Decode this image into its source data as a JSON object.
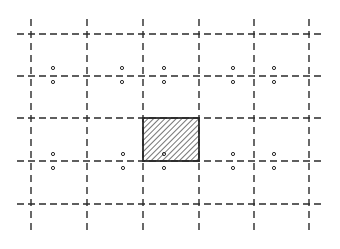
{
  "diagram": {
    "type": "dashed-grid-with-hatched-cell",
    "colors": {
      "background": "#ffffff",
      "line": "#2a2a2a",
      "hatch": "#2a2a2a",
      "dot": "#2a2a2a"
    },
    "vertical_lines": [
      {
        "x": 31,
        "y1": 19,
        "y2": 234
      },
      {
        "x": 87,
        "y1": 19,
        "y2": 234
      },
      {
        "x": 143,
        "y1": 19,
        "y2": 234
      },
      {
        "x": 199,
        "y1": 19,
        "y2": 234
      },
      {
        "x": 254,
        "y1": 19,
        "y2": 234
      },
      {
        "x": 309,
        "y1": 19,
        "y2": 234
      }
    ],
    "horizontal_lines": [
      {
        "y": 34,
        "x1": 17,
        "x2": 322
      },
      {
        "y": 76,
        "x1": 17,
        "x2": 322
      },
      {
        "y": 118,
        "x1": 17,
        "x2": 322
      },
      {
        "y": 161,
        "x1": 17,
        "x2": 322
      },
      {
        "y": 204,
        "x1": 17,
        "x2": 322
      }
    ],
    "hatched_cell": {
      "x": 143,
      "y": 118,
      "width": 56,
      "height": 43
    },
    "dots": [
      {
        "x": 53,
        "y": 68
      },
      {
        "x": 53,
        "y": 82
      },
      {
        "x": 122,
        "y": 68
      },
      {
        "x": 122,
        "y": 82
      },
      {
        "x": 164,
        "y": 68
      },
      {
        "x": 164,
        "y": 82
      },
      {
        "x": 233,
        "y": 68
      },
      {
        "x": 233,
        "y": 82
      },
      {
        "x": 274,
        "y": 68
      },
      {
        "x": 274,
        "y": 82
      },
      {
        "x": 53,
        "y": 154
      },
      {
        "x": 53,
        "y": 168
      },
      {
        "x": 123,
        "y": 154
      },
      {
        "x": 123,
        "y": 168
      },
      {
        "x": 164,
        "y": 154
      },
      {
        "x": 164,
        "y": 168
      },
      {
        "x": 233,
        "y": 154
      },
      {
        "x": 233,
        "y": 168
      },
      {
        "x": 274,
        "y": 154
      },
      {
        "x": 274,
        "y": 168
      }
    ]
  }
}
